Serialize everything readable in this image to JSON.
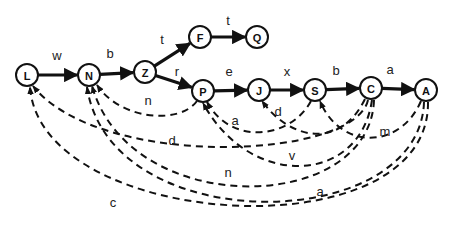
{
  "diagram": {
    "type": "automaton",
    "colors": {
      "stroke": "#111111",
      "background": "#ffffff"
    },
    "nodes": [
      {
        "id": "L",
        "label": "L"
      },
      {
        "id": "N",
        "label": "N"
      },
      {
        "id": "Z",
        "label": "Z"
      },
      {
        "id": "F",
        "label": "F"
      },
      {
        "id": "Q",
        "label": "Q"
      },
      {
        "id": "P",
        "label": "P"
      },
      {
        "id": "J",
        "label": "J"
      },
      {
        "id": "S",
        "label": "S"
      },
      {
        "id": "C",
        "label": "C"
      },
      {
        "id": "A",
        "label": "A"
      }
    ],
    "forward_edges": [
      {
        "from": "L",
        "to": "N",
        "label": "w"
      },
      {
        "from": "N",
        "to": "Z",
        "label": "b"
      },
      {
        "from": "Z",
        "to": "F",
        "label": "t"
      },
      {
        "from": "F",
        "to": "Q",
        "label": "t"
      },
      {
        "from": "Z",
        "to": "P",
        "label": "r"
      },
      {
        "from": "P",
        "to": "J",
        "label": "e"
      },
      {
        "from": "J",
        "to": "S",
        "label": "x"
      },
      {
        "from": "S",
        "to": "C",
        "label": "b"
      },
      {
        "from": "C",
        "to": "A",
        "label": "a"
      }
    ],
    "back_edges": [
      {
        "from": "P",
        "to": "N",
        "label": "n"
      },
      {
        "from": "S",
        "to": "P",
        "label": "a"
      },
      {
        "from": "C",
        "to": "J",
        "label": "d"
      },
      {
        "from": "A",
        "to": "S",
        "label": "m"
      },
      {
        "from": "C",
        "to": "L",
        "label": "d"
      },
      {
        "from": "C",
        "to": "P",
        "label": "v"
      },
      {
        "from": "C",
        "to": "N",
        "label": "n"
      },
      {
        "from": "A",
        "to": "N",
        "label": "a"
      },
      {
        "from": "A",
        "to": "L",
        "label": "c"
      }
    ]
  }
}
